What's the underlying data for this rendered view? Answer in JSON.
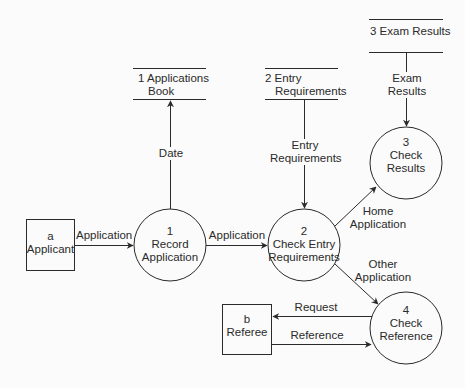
{
  "diagram": {
    "type": "data-flow-diagram",
    "colors": {
      "line": "#2a2a2a",
      "background": "#fbfbfb",
      "text": "#2a2a2a"
    },
    "external_entities": [
      {
        "id": "a",
        "line1": "a",
        "line2": "Applicant"
      },
      {
        "id": "b",
        "line1": "b",
        "line2": "Referee"
      }
    ],
    "processes": [
      {
        "id": "1",
        "number": "1",
        "line1": "Record",
        "line2": "Application"
      },
      {
        "id": "2",
        "number": "2",
        "line1": "Check Entry",
        "line2": "Requirements"
      },
      {
        "id": "3",
        "number": "3",
        "line1": "Check",
        "line2": "Results"
      },
      {
        "id": "4",
        "number": "4",
        "line1": "Check",
        "line2": "Reference"
      }
    ],
    "data_stores": [
      {
        "id": "1",
        "line1": "1 Applications",
        "line2": "Book"
      },
      {
        "id": "2",
        "line1": "2 Entry",
        "line2": "Requirements"
      },
      {
        "id": "3",
        "line1": "3 Exam Results",
        "line2": ""
      }
    ],
    "flows": [
      {
        "from": "a",
        "to": "1",
        "line1": "Application",
        "line2": ""
      },
      {
        "from": "1",
        "to": "store-1",
        "line1": "Date",
        "line2": ""
      },
      {
        "from": "1",
        "to": "2",
        "line1": "Application",
        "line2": ""
      },
      {
        "from": "store-2",
        "to": "2",
        "line1": "Entry",
        "line2": "Requirements"
      },
      {
        "from": "store-3",
        "to": "3",
        "line1": "Exam",
        "line2": "Results"
      },
      {
        "from": "2",
        "to": "3",
        "line1": "Home",
        "line2": "Application"
      },
      {
        "from": "2",
        "to": "4",
        "line1": "Other",
        "line2": "Application"
      },
      {
        "from": "4",
        "to": "b",
        "line1": "Request",
        "line2": ""
      },
      {
        "from": "b",
        "to": "4",
        "line1": "Reference",
        "line2": ""
      }
    ]
  }
}
